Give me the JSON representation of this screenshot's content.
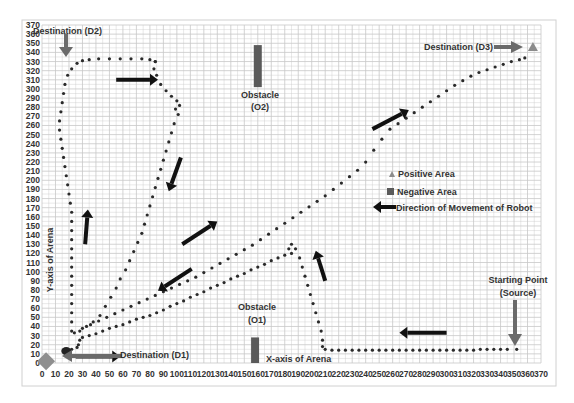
{
  "chart_data": {
    "type": "scatter",
    "title": "",
    "xlabel": "X-axis of Arena",
    "ylabel": "Y-axis of Arena",
    "xlim": [
      0,
      370
    ],
    "ylim": [
      0,
      370
    ],
    "x_ticks": [
      0,
      10,
      20,
      30,
      40,
      50,
      60,
      70,
      80,
      90,
      100,
      110,
      120,
      130,
      140,
      150,
      160,
      170,
      180,
      190,
      200,
      210,
      220,
      230,
      240,
      250,
      260,
      270,
      280,
      290,
      300,
      310,
      320,
      330,
      340,
      350,
      360,
      370
    ],
    "y_ticks": [
      0,
      10,
      20,
      30,
      40,
      50,
      60,
      70,
      80,
      90,
      100,
      110,
      120,
      130,
      140,
      150,
      160,
      170,
      180,
      190,
      200,
      210,
      220,
      230,
      240,
      250,
      260,
      270,
      280,
      290,
      300,
      310,
      320,
      330,
      340,
      350,
      360,
      370
    ],
    "grid": true,
    "minor_grid_step": 5,
    "legend": {
      "position": "right-middle",
      "entries": [
        {
          "label": "Positive Area",
          "marker": "triangle",
          "color": "#8c8c8c"
        },
        {
          "label": "Negative Area",
          "marker": "square",
          "color": "#5a5a5a"
        },
        {
          "label": "Direction of Movement of Robot",
          "marker": "arrow",
          "color": "#111111"
        }
      ]
    },
    "series": [
      {
        "name": "Path to D1 (from Source)",
        "points": [
          [
            352,
            15
          ],
          [
            345,
            15
          ],
          [
            340,
            15
          ],
          [
            335,
            15
          ],
          [
            330,
            15
          ],
          [
            325,
            15
          ],
          [
            320,
            14
          ],
          [
            315,
            14
          ],
          [
            310,
            14
          ],
          [
            305,
            14
          ],
          [
            300,
            14
          ],
          [
            295,
            14
          ],
          [
            290,
            14
          ],
          [
            285,
            14
          ],
          [
            280,
            14
          ],
          [
            275,
            14
          ],
          [
            270,
            14
          ],
          [
            265,
            14
          ],
          [
            260,
            14
          ],
          [
            255,
            14
          ],
          [
            250,
            14
          ],
          [
            245,
            14
          ],
          [
            240,
            14
          ],
          [
            235,
            14
          ],
          [
            230,
            14
          ],
          [
            225,
            14
          ],
          [
            220,
            14
          ],
          [
            215,
            14
          ],
          [
            210,
            15
          ],
          [
            208,
            18
          ],
          [
            208,
            25
          ],
          [
            207,
            35
          ],
          [
            205,
            45
          ],
          [
            203,
            55
          ],
          [
            201,
            65
          ],
          [
            199,
            75
          ],
          [
            197,
            85
          ],
          [
            195,
            95
          ],
          [
            193,
            105
          ],
          [
            191,
            115
          ],
          [
            188,
            125
          ],
          [
            185,
            130
          ],
          [
            183,
            125
          ],
          [
            185,
            120
          ],
          [
            180,
            118
          ],
          [
            175,
            115
          ],
          [
            170,
            112
          ],
          [
            165,
            108
          ],
          [
            160,
            105
          ],
          [
            155,
            102
          ],
          [
            150,
            98
          ],
          [
            145,
            95
          ],
          [
            140,
            92
          ],
          [
            135,
            88
          ],
          [
            130,
            85
          ],
          [
            125,
            82
          ],
          [
            120,
            78
          ],
          [
            115,
            75
          ],
          [
            110,
            72
          ],
          [
            105,
            68
          ],
          [
            100,
            65
          ],
          [
            95,
            62
          ],
          [
            90,
            58
          ],
          [
            85,
            55
          ],
          [
            80,
            52
          ],
          [
            75,
            50
          ],
          [
            70,
            48
          ],
          [
            65,
            45
          ],
          [
            60,
            42
          ],
          [
            55,
            40
          ],
          [
            50,
            38
          ],
          [
            45,
            35
          ],
          [
            40,
            32
          ],
          [
            35,
            30
          ],
          [
            30,
            28
          ],
          [
            28,
            25
          ],
          [
            27,
            20
          ],
          [
            26,
            17
          ],
          [
            22,
            15
          ],
          [
            20,
            13
          ]
        ]
      },
      {
        "name": "Path to D2",
        "points": [
          [
            22,
            35
          ],
          [
            22,
            45
          ],
          [
            22,
            55
          ],
          [
            22,
            65
          ],
          [
            22,
            75
          ],
          [
            22,
            85
          ],
          [
            22,
            95
          ],
          [
            22,
            105
          ],
          [
            22,
            115
          ],
          [
            22,
            125
          ],
          [
            22,
            135
          ],
          [
            22,
            145
          ],
          [
            22,
            155
          ],
          [
            22,
            165
          ],
          [
            21,
            175
          ],
          [
            20,
            185
          ],
          [
            19,
            195
          ],
          [
            18,
            205
          ],
          [
            17,
            215
          ],
          [
            16,
            225
          ],
          [
            15,
            235
          ],
          [
            14,
            245
          ],
          [
            13,
            255
          ],
          [
            13,
            265
          ],
          [
            14,
            275
          ],
          [
            15,
            285
          ],
          [
            16,
            295
          ],
          [
            17,
            305
          ],
          [
            19,
            315
          ],
          [
            22,
            322
          ],
          [
            26,
            328
          ],
          [
            30,
            331
          ],
          [
            35,
            332
          ],
          [
            42,
            333
          ],
          [
            50,
            333
          ],
          [
            58,
            333
          ],
          [
            66,
            333
          ],
          [
            74,
            333
          ],
          [
            80,
            332
          ],
          [
            84,
            330
          ]
        ]
      },
      {
        "name": "Path to D3",
        "points": [
          [
            84,
            330
          ],
          [
            83,
            322
          ],
          [
            85,
            315
          ],
          [
            88,
            305
          ],
          [
            92,
            298
          ],
          [
            96,
            292
          ],
          [
            100,
            287
          ],
          [
            102,
            282
          ],
          [
            99,
            278
          ],
          [
            101,
            272
          ],
          [
            98,
            262
          ],
          [
            96,
            252
          ],
          [
            94,
            242
          ],
          [
            92,
            232
          ],
          [
            90,
            222
          ],
          [
            88,
            212
          ],
          [
            86,
            202
          ],
          [
            84,
            192
          ],
          [
            82,
            182
          ],
          [
            80,
            172
          ],
          [
            78,
            162
          ],
          [
            76,
            152
          ],
          [
            74,
            142
          ],
          [
            71,
            132
          ],
          [
            68,
            122
          ],
          [
            65,
            112
          ],
          [
            62,
            102
          ],
          [
            58,
            92
          ],
          [
            55,
            82
          ],
          [
            51,
            72
          ],
          [
            47,
            62
          ],
          [
            43,
            52
          ],
          [
            38,
            45
          ],
          [
            33,
            40
          ],
          [
            28,
            35
          ],
          [
            24,
            33
          ],
          [
            30,
            38
          ],
          [
            36,
            42
          ],
          [
            42,
            46
          ],
          [
            48,
            50
          ],
          [
            54,
            54
          ],
          [
            60,
            58
          ],
          [
            66,
            62
          ],
          [
            72,
            66
          ],
          [
            78,
            70
          ],
          [
            84,
            74
          ],
          [
            90,
            78
          ],
          [
            96,
            82
          ],
          [
            102,
            86
          ],
          [
            108,
            90
          ],
          [
            114,
            94
          ],
          [
            120,
            99
          ],
          [
            126,
            104
          ],
          [
            132,
            109
          ],
          [
            138,
            114
          ],
          [
            144,
            119
          ],
          [
            150,
            124
          ],
          [
            156,
            129
          ],
          [
            162,
            135
          ],
          [
            168,
            141
          ],
          [
            174,
            147
          ],
          [
            180,
            153
          ],
          [
            186,
            159
          ],
          [
            192,
            165
          ],
          [
            198,
            171
          ],
          [
            204,
            177
          ],
          [
            210,
            183
          ],
          [
            216,
            190
          ],
          [
            222,
            197
          ],
          [
            228,
            204
          ],
          [
            234,
            211
          ],
          [
            240,
            220
          ],
          [
            246,
            233
          ],
          [
            252,
            245
          ],
          [
            258,
            256
          ],
          [
            264,
            262
          ],
          [
            270,
            268
          ],
          [
            276,
            274
          ],
          [
            282,
            280
          ],
          [
            288,
            286
          ],
          [
            294,
            292
          ],
          [
            300,
            298
          ],
          [
            306,
            304
          ],
          [
            312,
            309
          ],
          [
            318,
            314
          ],
          [
            324,
            318
          ],
          [
            330,
            321
          ],
          [
            336,
            324
          ],
          [
            342,
            327
          ],
          [
            348,
            330
          ],
          [
            354,
            332
          ],
          [
            358,
            334
          ]
        ]
      }
    ],
    "areas": {
      "positive": [
        {
          "name": "Destination (D3)",
          "x": 364,
          "y": 346
        }
      ],
      "negative": [
        {
          "name": "Obstacle (O2)",
          "x": 160,
          "y0": 302,
          "y1": 348
        },
        {
          "name": "Obstacle (O1)",
          "x": 158,
          "y0": 0,
          "y1": 28
        }
      ],
      "start_marker": {
        "name": "Destination (D1) marker",
        "x": 3,
        "y": 2
      }
    },
    "annotations": [
      {
        "text": "Destination (D2)",
        "x": 18,
        "y": 358
      },
      {
        "text": "Destination (D3)",
        "x": 290,
        "y": 346
      },
      {
        "text": "Obstacle",
        "x": 160,
        "y": 290
      },
      {
        "text": "(O2)",
        "x": 160,
        "y": 280
      },
      {
        "text": "Obstacle",
        "x": 160,
        "y": 48
      },
      {
        "text": "(O1)",
        "x": 160,
        "y": 38
      },
      {
        "text": "Destination (D1)",
        "x": 56,
        "y": 10
      },
      {
        "text": "Starting Point",
        "x": 350,
        "y": 70
      },
      {
        "text": "(Source)",
        "x": 350,
        "y": 60
      },
      {
        "text": "X-axis of Arena",
        "x": 163,
        "y": 3
      }
    ],
    "direction_arrows": [
      {
        "from": [
          55,
          310
        ],
        "to": [
          86,
          310
        ]
      },
      {
        "from": [
          103,
          225
        ],
        "to": [
          94,
          188
        ]
      },
      {
        "from": [
          32,
          130
        ],
        "to": [
          34,
          168
        ]
      },
      {
        "from": [
          104,
          130
        ],
        "to": [
          130,
          155
        ]
      },
      {
        "from": [
          111,
          103
        ],
        "to": [
          86,
          79
        ]
      },
      {
        "from": [
          245,
          256
        ],
        "to": [
          272,
          277
        ]
      },
      {
        "from": [
          210,
          90
        ],
        "to": [
          203,
          123
        ]
      },
      {
        "from": [
          300,
          33
        ],
        "to": [
          265,
          33
        ]
      },
      {
        "from": [
          25,
          7
        ],
        "to": [
          58,
          7
        ]
      }
    ]
  },
  "labels": {
    "dest_d2": "Destination (D2)",
    "dest_d3": "Destination (D3)",
    "dest_d1": "Destination (D1)",
    "obstacle_o2_line1": "Obstacle",
    "obstacle_o2_line2": "(O2)",
    "obstacle_o1_line1": "Obstacle",
    "obstacle_o1_line2": "(O1)",
    "start_line1": "Starting Point",
    "start_line2": "(Source)",
    "x_axis": "X-axis of Arena",
    "y_axis": "Y-axis of Arena",
    "legend_positive": "Positive Area",
    "legend_negative": "Negative Area",
    "legend_direction": "Direction of Movement of Robot"
  },
  "colors": {
    "grid": "#c8c8c8",
    "path": "#2a2a2a",
    "arrow": "#111111",
    "annotation_arrow": "#6b6b6b",
    "positive": "#8c8c8c",
    "negative": "#5a5a5a",
    "d1_marker": "#8f8f8f"
  }
}
